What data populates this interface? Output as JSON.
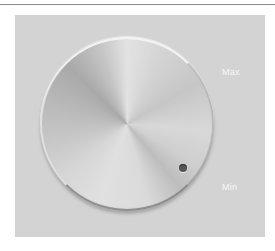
{
  "knob": {
    "labels": {
      "max": "Max",
      "min": "Min"
    },
    "indicator": "dot-indicator",
    "position": "near-min"
  },
  "colors": {
    "panel": "#d3d3d3",
    "indicator_dot": "#555555",
    "label_text": "#f7f7f7",
    "top_rule": "#8a8a8a"
  }
}
